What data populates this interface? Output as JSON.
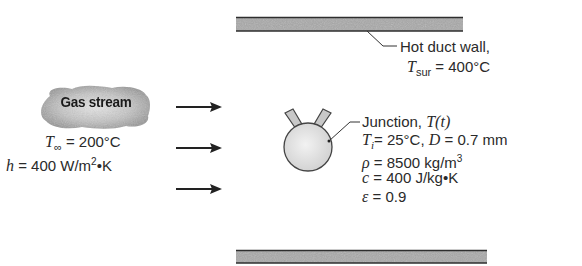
{
  "diagram": {
    "gas_stream": {
      "label": "Gas stream",
      "T_inf_symbol": "T",
      "T_inf_sub": "∞",
      "T_inf_value": " = 200°C",
      "h_symbol": "h",
      "h_value": " = 400 W/m",
      "h_exp": "2",
      "h_unit_tail": "•K"
    },
    "duct_wall": {
      "label": "Hot duct wall,",
      "T_sur_symbol": "T",
      "T_sur_sub": "sur",
      "T_sur_value": " = 400°C"
    },
    "junction": {
      "label": "Junction, ",
      "T_t": "T(t)",
      "Ti_symbol": "T",
      "Ti_sub": "i",
      "Ti_value": "= 25°C, ",
      "D_symbol": "D",
      "D_value": " = 0.7 mm",
      "rho_symbol": "ρ",
      "rho_value": " = 8500 kg/m",
      "rho_exp": "3",
      "c_symbol": "c",
      "c_value": " = 400 J/kg•K",
      "eps_symbol": "ε",
      "eps_value": " = 0.9"
    },
    "flow_arrows": 3,
    "colors": {
      "wall_fill": "#a8a8a8",
      "wall_edge": "#333333",
      "sphere_fill": "#e2e2e2",
      "cloud_fill": "#b5b5b5"
    }
  }
}
